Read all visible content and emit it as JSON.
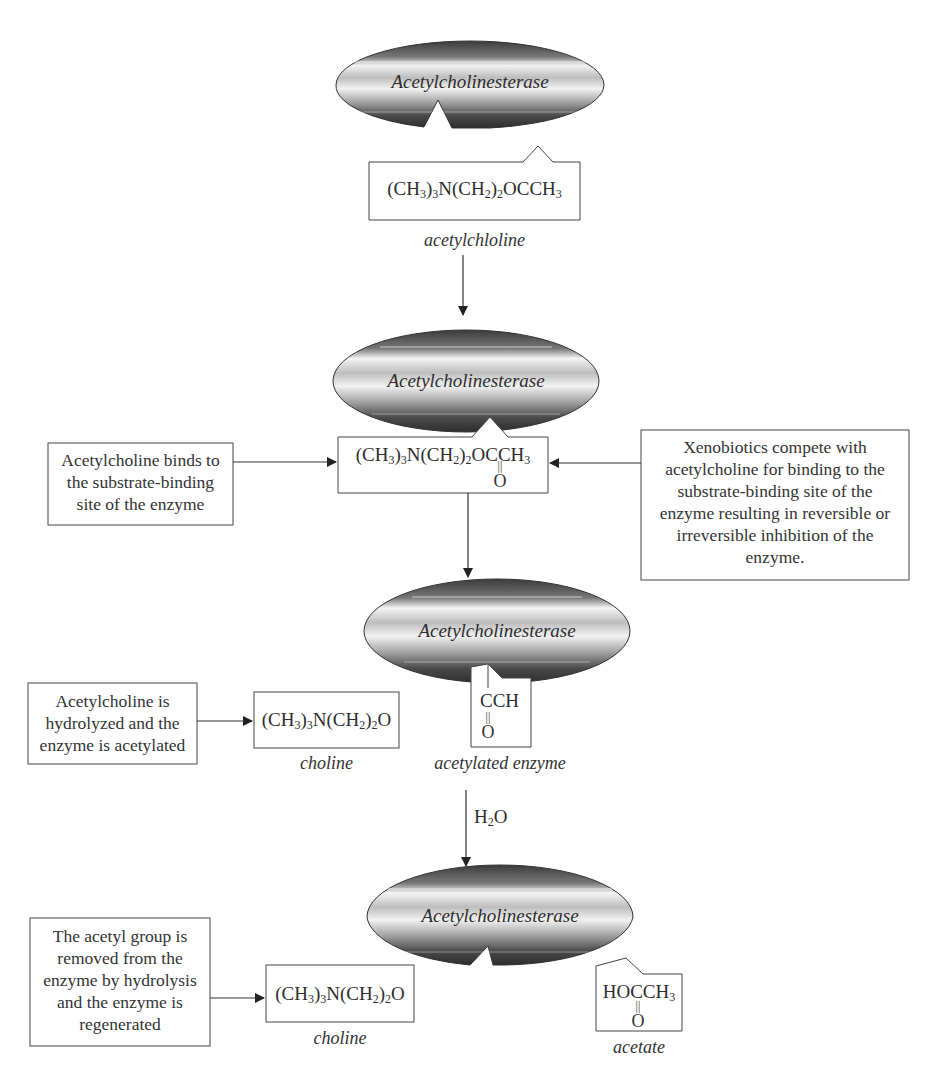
{
  "diagram": {
    "type": "reaction-mechanism-flowchart",
    "enzyme_label": "Acetylcholinesterase",
    "colors": {
      "ellipse_dark": "#3a3a3a",
      "ellipse_light": "#f0f0f0",
      "line": "#333333",
      "text": "#333333"
    },
    "step1": {
      "enzyme": "Acetylcholinesterase",
      "substrate_formula": "(CH3)3N(CH2)2OCCH3",
      "substrate_name": "acetylchloline"
    },
    "step2": {
      "enzyme": "Acetylcholinesterase",
      "bound_formula": "(CH3)3N(CH2)2OCCH3",
      "carbonyl_o": "O",
      "left_note": [
        "Acetylcholine binds to",
        "the substrate-binding",
        "site of the enzyme"
      ],
      "right_note": [
        "Xenobiotics compete with",
        "acetylcholine for binding to the",
        "substrate-binding site of the",
        "enzyme resulting in reversible or",
        "irreversible inhibition of the",
        "enzyme."
      ]
    },
    "step3": {
      "enzyme": "Acetylcholinesterase",
      "left_note": [
        "Acetylcholine is",
        "hydrolyzed and the",
        "enzyme is acetylated"
      ],
      "product_formula": "(CH3)3N(CH2)2O",
      "product_name": "choline",
      "acyl_formula": "CCH",
      "acyl_o": "O",
      "acyl_name": "acetylated enzyme",
      "reagent": "H2O"
    },
    "step4": {
      "enzyme": "Acetylcholinesterase",
      "left_note": [
        "The acetyl group is",
        "removed from the",
        "enzyme by hydrolysis",
        "and the enzyme is",
        "regenerated"
      ],
      "product_formula": "(CH3)3N(CH2)2O",
      "product_name": "choline",
      "acetate_formula": "HOCCH3",
      "acetate_o": "O",
      "acetate_name": "acetate"
    }
  }
}
